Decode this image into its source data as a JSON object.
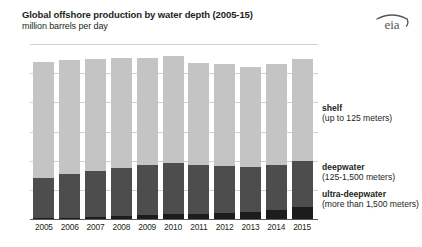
{
  "header": {
    "title": "Global offshore production by water depth (2005-15)",
    "subtitle": "million barrels per day",
    "logo_text": "eia"
  },
  "legend": [
    {
      "name": "shelf",
      "detail": "(up to 125 meters)",
      "color": "#c4c4c4"
    },
    {
      "name": "deepwater",
      "detail": "(125-1,500 meters)",
      "color": "#4d4d4d"
    },
    {
      "name": "ultra-deepwater",
      "detail": "(more than 1,500 meters)",
      "color": "#1c1c1c"
    }
  ],
  "axis": {
    "y_ticks": [
      "30",
      "25",
      "20",
      "15",
      "10",
      "5",
      "0"
    ],
    "x_ticks": [
      "2005",
      "2006",
      "2007",
      "2008",
      "2009",
      "2010",
      "2011",
      "2012",
      "2013",
      "2014",
      "2015"
    ]
  },
  "chart_data": {
    "type": "bar",
    "stacked": true,
    "title": "Global offshore production by water depth (2005-15)",
    "subtitle": "million barrels per day",
    "xlabel": "",
    "ylabel": "million barrels per day",
    "ylim": [
      0,
      30
    ],
    "ytick_step": 5,
    "grid": true,
    "legend_position": "right",
    "categories": [
      "2005",
      "2006",
      "2007",
      "2008",
      "2009",
      "2010",
      "2011",
      "2012",
      "2013",
      "2014",
      "2015"
    ],
    "series": [
      {
        "name": "ultra-deepwater",
        "detail": "more than 1,500 meters",
        "color": "#1c1c1c",
        "values": [
          0.1,
          0.2,
          0.3,
          0.5,
          0.7,
          0.8,
          0.9,
          1.0,
          1.2,
          1.5,
          2.0
        ]
      },
      {
        "name": "deepwater",
        "detail": "125-1,500 meters",
        "color": "#4d4d4d",
        "values": [
          6.9,
          7.6,
          7.9,
          8.3,
          8.6,
          8.8,
          8.3,
          8.1,
          7.8,
          7.7,
          8.0
        ]
      },
      {
        "name": "shelf",
        "detail": "up to 125 meters",
        "color": "#c4c4c4",
        "values": [
          20.0,
          19.4,
          19.3,
          18.8,
          18.3,
          18.4,
          17.5,
          17.4,
          17.1,
          17.3,
          17.5
        ]
      }
    ],
    "totals": [
      27.0,
      27.2,
      27.5,
      27.6,
      27.6,
      28.0,
      26.7,
      26.5,
      26.1,
      26.5,
      27.5
    ]
  }
}
